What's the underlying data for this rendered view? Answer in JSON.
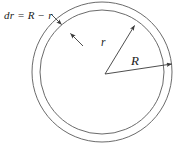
{
  "figure": {
    "kind": "geometry-diagram",
    "background_color": "#ffffff",
    "stroke_color": "#595959",
    "text_color": "#1b1b1b",
    "labels": {
      "thickness": "dr = R − r",
      "inner_radius": "r",
      "outer_radius": "R"
    },
    "geometry": {
      "center_x": 102,
      "center_y": 72,
      "outer_radius_px": 70,
      "inner_radius_px": 62,
      "units": "px"
    },
    "leaders": {
      "thickness_leader_label": "dr = R − r",
      "inner_radius_leader_label": "r",
      "outer_radius_leader_label": "R"
    }
  }
}
